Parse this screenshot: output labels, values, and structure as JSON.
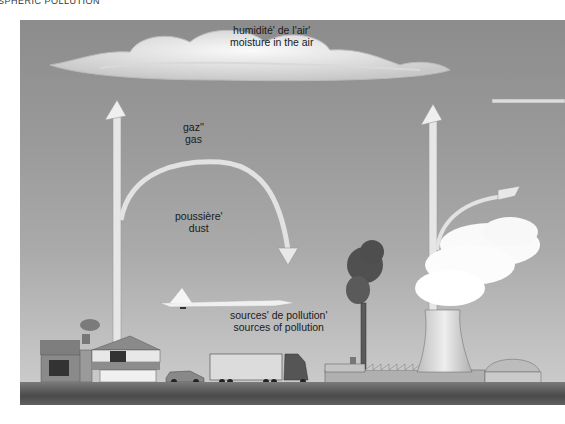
{
  "page": {
    "title": "SPHERIC POLLUTION"
  },
  "diagram": {
    "labels": {
      "moisture": {
        "fr": "humidité' de l'air'",
        "en": "moisture in the air"
      },
      "gas": {
        "fr": "gaz''",
        "en": "gas"
      },
      "dust": {
        "fr": "poussière'",
        "en": "dust"
      },
      "sources": {
        "fr": "sources' de pollution'",
        "en": "sources of pollution"
      }
    },
    "elements": [
      "cloud",
      "upward-arrow-left",
      "curved-arrow-dust",
      "airplane",
      "house",
      "car",
      "truck",
      "factory-chimney",
      "smoke",
      "cooling-tower",
      "steam",
      "upward-arrow-right",
      "curved-arrow-right",
      "dome-building",
      "ground"
    ],
    "colors": {
      "background": "#9a9a9a",
      "ground": "#555555",
      "arrow": "#e6e6e6",
      "cloud": "#f2f2f2"
    }
  }
}
